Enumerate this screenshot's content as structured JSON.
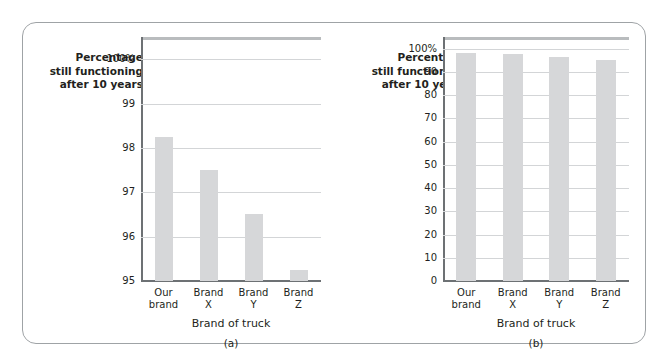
{
  "figure": {
    "panels": [
      {
        "id": "a",
        "caption": "(a)",
        "ylabel_lines": [
          "Percentage",
          "still functioning",
          "after 10 years"
        ],
        "xlabel": "Brand of truck"
      },
      {
        "id": "b",
        "caption": "(b)",
        "ylabel_lines": [
          "Percentage",
          "still functioning",
          "after 10 years"
        ],
        "xlabel": "Brand of truck"
      }
    ],
    "colors": {
      "bar": "#d6d7d9",
      "gridline": "#d3d5d7",
      "axis": "#6d7174",
      "frame": "#9fa3a6",
      "text": "#231f20"
    }
  },
  "chart_data": [
    {
      "type": "bar",
      "panel": "a",
      "title": "",
      "categories": [
        "Our brand",
        "Brand X",
        "Brand Y",
        "Brand Z"
      ],
      "values": [
        98.25,
        97.5,
        96.5,
        95.25
      ],
      "xlabel": "Brand of truck",
      "ylabel": "Percentage still functioning after 10 years",
      "ylim": [
        95,
        100.5
      ],
      "yticks": [
        95,
        96,
        97,
        98,
        99,
        100
      ],
      "yticklabels": [
        "95",
        "96",
        "97",
        "98",
        "99",
        "100%"
      ],
      "grid": true,
      "legend": "none",
      "caption": "(a)"
    },
    {
      "type": "bar",
      "panel": "b",
      "title": "",
      "categories": [
        "Our brand",
        "Brand X",
        "Brand Y",
        "Brand Z"
      ],
      "values": [
        98.25,
        97.5,
        96.5,
        95.25
      ],
      "xlabel": "Brand of truck",
      "ylabel": "Percentage still functioning after 10 years",
      "ylim": [
        0,
        105
      ],
      "yticks": [
        0,
        10,
        20,
        30,
        40,
        50,
        60,
        70,
        80,
        90,
        100
      ],
      "yticklabels": [
        "0",
        "10",
        "20",
        "30",
        "40",
        "50",
        "60",
        "70",
        "80",
        "90",
        "100%"
      ],
      "grid": true,
      "legend": "none",
      "caption": "(b)"
    }
  ]
}
